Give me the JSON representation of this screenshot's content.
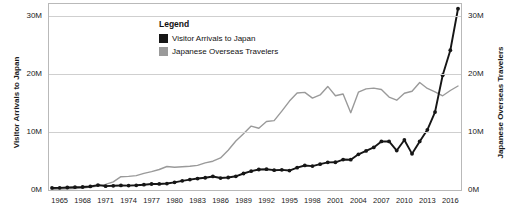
{
  "chart_data": {
    "type": "line",
    "title": "",
    "xlabel": "",
    "ylabel": "Visitor Arrivals to Japan",
    "ylabel_right": "Japanese Overseas Travelers",
    "xlim": [
      1964,
      2017
    ],
    "ylim": [
      0,
      32
    ],
    "ylim_right": [
      0,
      32
    ],
    "grid": true,
    "legend_position": "top-left-inside",
    "y_tick_labels": [
      "0M",
      "10M",
      "20M",
      "30M"
    ],
    "y_tick_values": [
      0,
      10,
      20,
      30
    ],
    "y_tick_labels_right": [
      "0M",
      "10M",
      "20M",
      "30M"
    ],
    "y_tick_values_right": [
      0,
      10,
      20,
      30
    ],
    "x_tick_labels": [
      "1965",
      "1968",
      "1971",
      "1974",
      "1977",
      "1980",
      "1983",
      "1986",
      "1989",
      "1992",
      "1995",
      "1998",
      "2001",
      "2004",
      "2007",
      "2010",
      "2013",
      "2016"
    ],
    "x_tick_values": [
      1965,
      1968,
      1971,
      1974,
      1977,
      1980,
      1983,
      1986,
      1989,
      1992,
      1995,
      1998,
      2001,
      2004,
      2007,
      2010,
      2013,
      2016
    ],
    "x": [
      1964,
      1965,
      1966,
      1967,
      1968,
      1969,
      1970,
      1971,
      1972,
      1973,
      1974,
      1975,
      1976,
      1977,
      1978,
      1979,
      1980,
      1981,
      1982,
      1983,
      1984,
      1985,
      1986,
      1987,
      1988,
      1989,
      1990,
      1991,
      1992,
      1993,
      1994,
      1995,
      1996,
      1997,
      1998,
      1999,
      2000,
      2001,
      2002,
      2003,
      2004,
      2005,
      2006,
      2007,
      2008,
      2009,
      2010,
      2011,
      2012,
      2013,
      2014,
      2015,
      2016,
      2017
    ],
    "series": [
      {
        "name": "Visitor Arrivals to Japan",
        "color": "#161616",
        "markers": true,
        "axis": "left",
        "values": [
          0.35,
          0.37,
          0.43,
          0.48,
          0.52,
          0.61,
          0.85,
          0.66,
          0.72,
          0.78,
          0.76,
          0.81,
          0.91,
          1.03,
          1.04,
          1.11,
          1.32,
          1.58,
          1.79,
          1.97,
          2.11,
          2.33,
          2.06,
          2.15,
          2.36,
          2.84,
          3.24,
          3.53,
          3.58,
          3.41,
          3.47,
          3.35,
          3.84,
          4.22,
          4.11,
          4.44,
          4.76,
          4.77,
          5.24,
          5.21,
          6.14,
          6.73,
          7.33,
          8.35,
          8.35,
          6.79,
          8.61,
          6.22,
          8.36,
          10.36,
          13.41,
          19.74,
          24.04,
          31.19
        ]
      },
      {
        "name": "Japanese Overseas Travelers",
        "color": "#9a9a9a",
        "markers": false,
        "axis": "right",
        "values": [
          0.13,
          0.16,
          0.21,
          0.27,
          0.34,
          0.49,
          0.66,
          0.96,
          1.39,
          2.29,
          2.34,
          2.47,
          2.85,
          3.15,
          3.53,
          4.04,
          3.91,
          4.01,
          4.09,
          4.23,
          4.66,
          4.95,
          5.52,
          6.83,
          8.43,
          9.66,
          10.997,
          10.63,
          11.79,
          11.93,
          13.58,
          15.3,
          16.69,
          16.8,
          15.81,
          16.36,
          17.82,
          16.22,
          16.52,
          13.3,
          16.83,
          17.4,
          17.53,
          17.29,
          15.99,
          15.45,
          16.64,
          16.99,
          18.49,
          17.47,
          16.9,
          16.21,
          17.12,
          17.89
        ]
      }
    ]
  },
  "legend": {
    "title": "Legend",
    "items": [
      {
        "label": "Visitor Arrivals to Japan",
        "color": "#161616"
      },
      {
        "label": "Japanese Overseas Travelers",
        "color": "#9a9a9a"
      }
    ]
  },
  "axes": {
    "left_title": "Visitor Arrivals to Japan",
    "right_title": "Japanese Overseas Travelers"
  }
}
